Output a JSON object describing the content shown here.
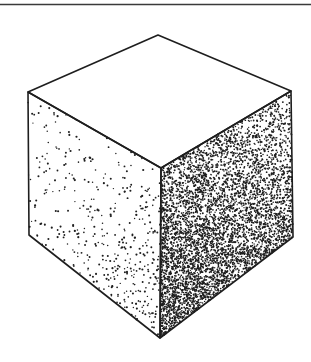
{
  "figure": {
    "width": 311,
    "height": 362,
    "background": "#ffffff",
    "ink": "#1e1e1e",
    "top_rule": {
      "y": 4.5,
      "x1": 0,
      "x2": 311,
      "stroke_width": 1.4,
      "color": "#3a3a3a"
    },
    "cube": {
      "vertices": {
        "top": [
          158,
          35
        ],
        "left": [
          28,
          92
        ],
        "right": [
          291,
          91
        ],
        "center": [
          161,
          168
        ],
        "bottom_left": [
          29,
          235
        ],
        "bottom_right": [
          293,
          237
        ],
        "bottom": [
          160,
          338
        ]
      },
      "edge_stroke_width": 1.6,
      "faces": {
        "top": {
          "stipple": "none"
        },
        "left": {
          "stipple": "sparse",
          "dots": 420,
          "min_density": 0.08,
          "max_density": 0.55,
          "dot_radius": 0.85
        },
        "right": {
          "stipple": "dense",
          "dots": 5200,
          "min_density": 0.25,
          "max_density": 1.0,
          "dot_radius": 0.8
        }
      }
    }
  }
}
